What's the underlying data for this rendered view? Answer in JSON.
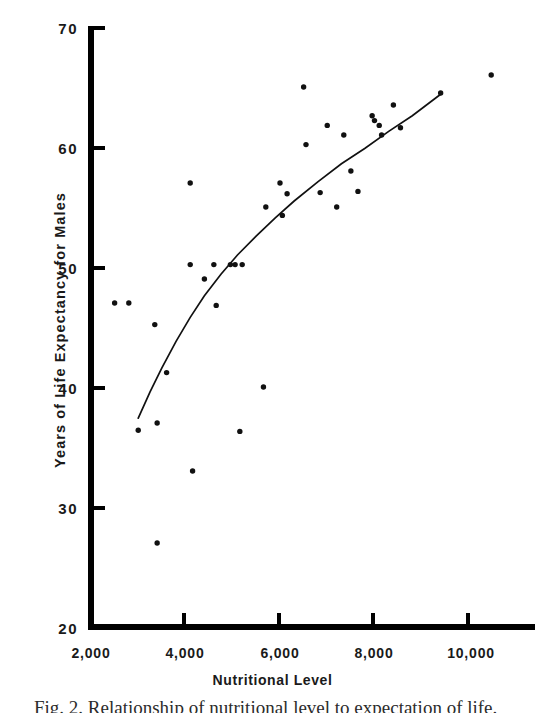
{
  "figure": {
    "caption": "Fig. 2. Relationship of nutritional level to expectation of life."
  },
  "axes": {
    "y_label": "Years of Life Expectancy for Males",
    "x_label": "Nutritional Level",
    "y_ticks": [
      "70",
      "60",
      "50",
      "40",
      "30",
      "20"
    ],
    "x_ticks": [
      "2,000",
      "4,000",
      "6,000",
      "8,000",
      "10,000"
    ]
  },
  "colors": {
    "ink": "#000000",
    "background": "#ffffff",
    "point": "#111111",
    "curve": "#111111"
  },
  "chart_data": {
    "type": "scatter",
    "title": "",
    "xlabel": "Nutritional Level",
    "ylabel": "Years of Life Expectancy for Males",
    "xlim": [
      2000,
      11200
    ],
    "ylim": [
      20,
      70
    ],
    "xticks": [
      2000,
      4000,
      6000,
      8000,
      10000
    ],
    "xticklabels": [
      "2,000",
      "4,000",
      "6,000",
      "8,000",
      "10,000"
    ],
    "yticks": [
      20,
      30,
      40,
      50,
      60,
      70
    ],
    "yticklabels": [
      "20",
      "30",
      "40",
      "50",
      "60",
      "70"
    ],
    "grid": false,
    "legend": false,
    "points": [
      [
        2500,
        47.0
      ],
      [
        2800,
        47.0
      ],
      [
        3000,
        36.4
      ],
      [
        3350,
        45.2
      ],
      [
        3400,
        37.0
      ],
      [
        3400,
        27.0
      ],
      [
        3600,
        41.2
      ],
      [
        4100,
        57.0
      ],
      [
        4100,
        50.2
      ],
      [
        4150,
        33.0
      ],
      [
        4400,
        49.0
      ],
      [
        4600,
        50.2
      ],
      [
        4650,
        46.8
      ],
      [
        4950,
        50.2
      ],
      [
        5050,
        50.2
      ],
      [
        5150,
        36.3
      ],
      [
        5200,
        50.2
      ],
      [
        5650,
        40.0
      ],
      [
        5700,
        55.0
      ],
      [
        6000,
        57.0
      ],
      [
        6050,
        54.3
      ],
      [
        6150,
        56.1
      ],
      [
        6500,
        65.0
      ],
      [
        6550,
        60.2
      ],
      [
        6850,
        56.2
      ],
      [
        7000,
        61.8
      ],
      [
        7200,
        55.0
      ],
      [
        7350,
        61.0
      ],
      [
        7500,
        58.0
      ],
      [
        7650,
        56.3
      ],
      [
        7950,
        62.6
      ],
      [
        8000,
        62.2
      ],
      [
        8100,
        61.8
      ],
      [
        8150,
        61.0
      ],
      [
        8400,
        63.5
      ],
      [
        8550,
        61.6
      ],
      [
        9400,
        64.5
      ],
      [
        10470,
        66.0
      ]
    ],
    "fit_curve": {
      "label": "fitted trend curve",
      "x": [
        3000,
        3250,
        3500,
        3800,
        4100,
        4400,
        4750,
        5100,
        5500,
        5900,
        6300,
        6800,
        7300,
        7800,
        8300,
        8800,
        9400
      ],
      "y": [
        37.4,
        39.6,
        41.6,
        43.8,
        45.8,
        47.6,
        49.4,
        51.0,
        52.6,
        54.1,
        55.5,
        57.1,
        58.6,
        59.9,
        61.3,
        62.6,
        64.4
      ]
    }
  }
}
